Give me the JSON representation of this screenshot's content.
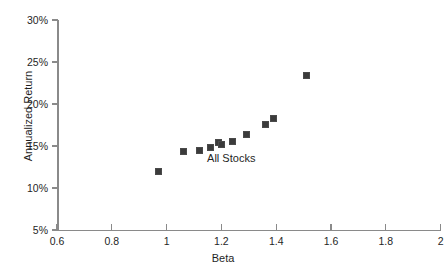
{
  "chart_data": {
    "type": "scatter",
    "title": "",
    "xlabel": "Beta",
    "ylabel": "Annualized Return",
    "xlim": [
      0.6,
      2.0
    ],
    "ylim": [
      5,
      30
    ],
    "grid": false,
    "legend_position": "none",
    "x_tick_labels": [
      "0.6",
      "0.8",
      "1",
      "1.2",
      "1.4",
      "1.6",
      "1.8",
      "2"
    ],
    "x_tick_values": [
      0.6,
      0.8,
      1.0,
      1.2,
      1.4,
      1.6,
      1.8,
      2.0
    ],
    "y_tick_labels": [
      "30%",
      "25%",
      "20%",
      "15%",
      "10%",
      "5%"
    ],
    "y_tick_values": [
      30,
      25,
      20,
      15,
      10,
      5
    ],
    "y_unit": "%",
    "annotations": [
      {
        "text": "All Stocks",
        "x": 1.25,
        "y": 13.6
      }
    ],
    "series": [
      {
        "name": "All Stocks",
        "marker": "square",
        "color": "#3b3b3b",
        "points": [
          {
            "x": 0.97,
            "y": 12.0
          },
          {
            "x": 1.06,
            "y": 14.3
          },
          {
            "x": 1.12,
            "y": 14.5
          },
          {
            "x": 1.16,
            "y": 14.8
          },
          {
            "x": 1.19,
            "y": 15.4
          },
          {
            "x": 1.2,
            "y": 15.2
          },
          {
            "x": 1.24,
            "y": 15.5
          },
          {
            "x": 1.29,
            "y": 16.4
          },
          {
            "x": 1.36,
            "y": 17.6
          },
          {
            "x": 1.39,
            "y": 18.3
          },
          {
            "x": 1.51,
            "y": 23.4
          }
        ]
      }
    ]
  },
  "colors": {
    "axis": "#8a8a8a",
    "text": "#1f1f1f",
    "marker": "#3b3b3b",
    "background": "#ffffff"
  }
}
